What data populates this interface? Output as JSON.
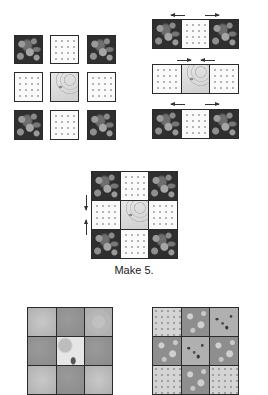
{
  "diagram": {
    "type": "quilt-block-assembly",
    "fabric_legend": {
      "dark": "dark floral print",
      "dots": "light dotted print",
      "swirl": "light swirl print (center)"
    },
    "step1_layout": {
      "rows": [
        [
          "dark",
          "dots",
          "dark"
        ],
        [
          "dots",
          "swirl",
          "dots"
        ],
        [
          "dark",
          "dots",
          "dark"
        ]
      ]
    },
    "step2_rows": [
      {
        "fabrics": [
          "dark",
          "dots",
          "dark"
        ],
        "press_arrows": [
          "left",
          "right"
        ],
        "arrow_direction": "outward"
      },
      {
        "fabrics": [
          "dots",
          "swirl",
          "dots"
        ],
        "press_arrows": [
          "right",
          "left"
        ],
        "arrow_direction": "inward"
      },
      {
        "fabrics": [
          "dark",
          "dots",
          "dark"
        ],
        "press_arrows": [
          "left",
          "right"
        ],
        "arrow_direction": "outward"
      }
    ],
    "step3_block": {
      "rows": [
        [
          "dark",
          "dots",
          "dark"
        ],
        [
          "dots",
          "swirl",
          "dots"
        ],
        [
          "dark",
          "dots",
          "dark"
        ]
      ],
      "seam_arrows": [
        "down",
        "up"
      ],
      "caption": "Make 5."
    },
    "bottom_variations": [
      {
        "name": "variation-gray",
        "rows_visible": [
          [
            "gA",
            "gB",
            "gC"
          ],
          [
            "gB",
            "gW",
            "gB"
          ],
          [
            "gA",
            "gB",
            "gA"
          ]
        ]
      },
      {
        "name": "variation-print",
        "rows_visible": [
          [
            "pDot",
            "pFlw",
            "pLeaf"
          ],
          [
            "pFlw",
            "pLeaf",
            "pFlw"
          ],
          [
            "pDot",
            "pFlw",
            "pDot"
          ]
        ]
      }
    ]
  }
}
